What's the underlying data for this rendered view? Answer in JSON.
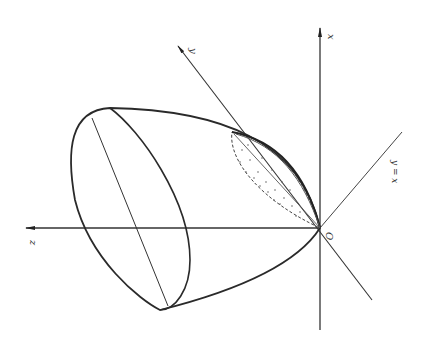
{
  "diagram": {
    "colors": {
      "stroke": "#2a2a2a",
      "axis": "#333333",
      "background": "#ffffff"
    },
    "labels": {
      "x_axis": "x",
      "y_axis": "y",
      "z_axis": "z",
      "plane": "y = x",
      "origin": "O"
    }
  }
}
